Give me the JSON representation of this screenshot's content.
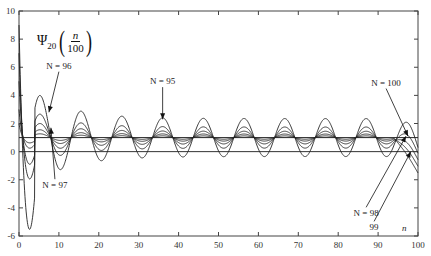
{
  "chart_data": {
    "type": "line",
    "title_parts": {
      "symbol": "Ψ",
      "subscript": "20",
      "numerator": "n",
      "denominator": "100"
    },
    "xlabel": "n",
    "ylabel": "",
    "xlim": [
      0,
      100
    ],
    "ylim": [
      -6,
      10
    ],
    "x_ticks": [
      0,
      10,
      20,
      30,
      40,
      50,
      60,
      70,
      80,
      90,
      100
    ],
    "y_ticks": [
      10,
      8,
      6,
      4,
      2,
      0,
      -2,
      -4,
      -6
    ],
    "grid": false,
    "baseline_y": 1,
    "series": [
      {
        "name": "N = 95",
        "amplitude": 1.35,
        "period": 10.2,
        "phase_peak_x": 36,
        "initial_peak": 9.0,
        "initial_min": -5.8,
        "description": "largest oscillation; peaks ~5 at n≈8, ~2.3 at n≈36"
      },
      {
        "name": "N = 96",
        "amplitude": 0.75,
        "period": 10.2,
        "phase_peak_x": 36,
        "initial_peak": 7.0,
        "initial_min": -2.1,
        "description": "peak ~2.8 at n≈8"
      },
      {
        "name": "N = 97",
        "amplitude": 0.45,
        "period": 10.2,
        "phase_peak_x": 36,
        "initial_peak": 5.0,
        "initial_min": -1.0,
        "description": "peak ~1.7 at n≈8"
      },
      {
        "name": "N = 98",
        "amplitude": 0.25,
        "period": 10.2,
        "phase_peak_x": 36,
        "initial_peak": 3.0,
        "initial_min": 0.2
      },
      {
        "name": "N = 99",
        "amplitude": 0.12,
        "period": 10.2,
        "phase_peak_x": 36,
        "initial_peak": 2.0,
        "initial_min": 0.6
      },
      {
        "name": "N = 100",
        "amplitude": 0.0,
        "period": 10.2,
        "phase_peak_x": 36,
        "initial_peak": 1.0,
        "initial_min": 1.0,
        "description": "flat ~1"
      }
    ],
    "annotations": [
      {
        "text": "N = 96",
        "x": 10,
        "y": 5.9,
        "arrow_to": [
          7.5,
          2.8
        ]
      },
      {
        "text": "N = 95",
        "x": 36,
        "y": 4.8,
        "arrow_to": [
          36,
          2.3
        ]
      },
      {
        "text": "N = 97",
        "x": 9,
        "y": -2.6,
        "arrow_to": [
          8,
          1.7
        ]
      },
      {
        "text": "N = 100",
        "x": 92,
        "y": 4.7,
        "arrow_to": [
          97.5,
          1.1
        ]
      },
      {
        "text": "N = 98",
        "x": 87,
        "y": -4.6,
        "arrow_to": [
          97,
          1.1
        ]
      },
      {
        "text": "99",
        "x": 89,
        "y": -5.6,
        "arrow_to": [
          98.2,
          0
        ]
      }
    ]
  }
}
